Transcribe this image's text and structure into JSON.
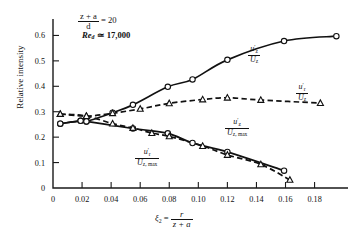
{
  "chart_data": {
    "type": "scatter",
    "title": "",
    "xlabel": "ξ₂ = r/(z + a)",
    "ylabel": "Relative intensity",
    "xlim": [
      0,
      0.203
    ],
    "ylim": [
      0,
      0.645
    ],
    "xticks": [
      "0",
      "0.02",
      "0.04",
      "0.06",
      "0.08",
      "0.10",
      "0.12",
      "0.14",
      "0.16",
      "0.18"
    ],
    "xtick_values": [
      0,
      0.02,
      0.04,
      0.06,
      0.08,
      0.1,
      0.12,
      0.14,
      0.16,
      0.18
    ],
    "yticks": [
      "0",
      "0.1",
      "0.2",
      "0.3",
      "0.4",
      "0.5",
      "0.6"
    ],
    "ytick_values": [
      0,
      0.1,
      0.2,
      0.3,
      0.4,
      0.5,
      0.6
    ],
    "grid": false,
    "legend_position": "inline-annotations",
    "annotations": [
      {
        "name": "length-ratio",
        "text": "(z + a)/d = 20"
      },
      {
        "name": "reynolds-number",
        "text": "Re_d ≃ 17,000"
      }
    ],
    "series": [
      {
        "name": "uz_prime_over_Uz",
        "label": "u'z / Ūz",
        "marker": "circle",
        "line": "solid",
        "x": [
          0.005,
          0.019,
          0.023,
          0.041,
          0.055,
          0.079,
          0.096,
          0.12,
          0.159,
          0.195
        ],
        "y": [
          0.253,
          0.264,
          0.262,
          0.296,
          0.327,
          0.398,
          0.427,
          0.504,
          0.578,
          0.597
        ]
      },
      {
        "name": "ur_prime_over_Uz",
        "label": "u'r / Ūz",
        "marker": "triangle",
        "line": "dashed",
        "x": [
          0.005,
          0.023,
          0.041,
          0.06,
          0.08,
          0.103,
          0.12,
          0.143,
          0.184
        ],
        "y": [
          0.291,
          0.283,
          0.294,
          0.311,
          0.333,
          0.348,
          0.355,
          0.346,
          0.334
        ]
      },
      {
        "name": "uz_prime_over_Uz_max",
        "label": "u'z / Ūz,max",
        "marker": "circle",
        "line": "solid",
        "x": [
          0.005,
          0.019,
          0.023,
          0.055,
          0.079,
          0.096,
          0.12,
          0.159
        ],
        "y": [
          0.253,
          0.264,
          0.262,
          0.234,
          0.215,
          0.177,
          0.142,
          0.068
        ]
      },
      {
        "name": "ur_prime_over_Uz_max",
        "label": "u'r / Ūz,max",
        "marker": "triangle",
        "line": "dashed",
        "x": [
          0.005,
          0.023,
          0.041,
          0.055,
          0.068,
          0.08,
          0.103,
          0.12,
          0.143,
          0.163
        ],
        "y": [
          0.291,
          0.283,
          0.253,
          0.236,
          0.216,
          0.203,
          0.165,
          0.13,
          0.093,
          0.032
        ]
      }
    ]
  },
  "annotations": {
    "ratio_num": "z + a",
    "ratio_den": "d",
    "ratio_eq": "= 20",
    "re_symbol": "Re",
    "re_sub": "d",
    "re_eq": "≃ 17,000"
  },
  "axes": {
    "ylabel": "Relative intensity",
    "xlabel_lead": "ξ",
    "xlabel_sub": "2",
    "xlabel_eq": "=",
    "xlabel_num": "r",
    "xlabel_den": "z + a"
  },
  "curve_labels": {
    "uz_uz": {
      "num": "u",
      "num_prime": "′",
      "num_sub": "z",
      "den": "U",
      "den_sub": "z"
    },
    "ur_uz": {
      "num": "u",
      "num_prime": "′",
      "num_sub": "r",
      "den": "U",
      "den_sub": "z"
    },
    "uz_uzmax": {
      "num": "u",
      "num_prime": "′",
      "num_sub": "z",
      "den": "U",
      "den_sub": "z, max"
    },
    "ur_uzmax": {
      "num": "u",
      "num_prime": "′",
      "num_sub": "r",
      "den": "U",
      "den_sub": "z, max"
    }
  },
  "colors": {
    "ink": "#111111",
    "background": "#ffffff"
  }
}
